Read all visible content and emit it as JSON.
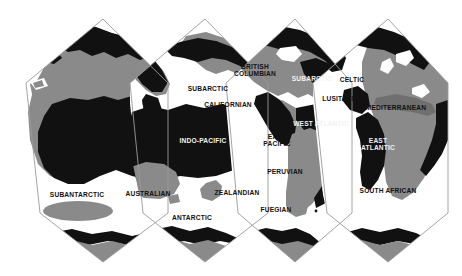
{
  "map": {
    "title": "Marine biogeographic provinces world map",
    "projection": "interrupted equal-area (Goode-homolosine style), four lobes",
    "colors": {
      "ocean_open": "#ffffff",
      "land": "#8a8a8a",
      "shelf_province_fill": "#111111",
      "graticule_outline": "#9a9a9a",
      "label_dark": "#111111",
      "label_light": "#f2f2f2",
      "background": "#ffffff"
    },
    "legend_note": "Black = warm/shelf marine provinces, Gray = land, White = labelled cold-water provinces",
    "labels": [
      {
        "id": "arctic",
        "text": "ARCTIC",
        "x": 205,
        "y": 44,
        "tone": "dark",
        "lines": 1
      },
      {
        "id": "british-columbian",
        "text": "BRITISH\nCOLUMBIAN",
        "x": 255,
        "y": 70,
        "tone": "dark",
        "lines": 2
      },
      {
        "id": "subarctic-pacific",
        "text": "SUBARCTIC",
        "x": 208,
        "y": 89,
        "tone": "dark",
        "lines": 1
      },
      {
        "id": "californian",
        "text": "CALIFORNIAN",
        "x": 228,
        "y": 105,
        "tone": "dark",
        "lines": 1
      },
      {
        "id": "subarctic-atlantic",
        "text": "SUBARCTIC",
        "x": 312,
        "y": 79,
        "tone": "light",
        "lines": 1
      },
      {
        "id": "celtic",
        "text": "CELTIC",
        "x": 352,
        "y": 80,
        "tone": "dark",
        "lines": 1
      },
      {
        "id": "lusitanian",
        "text": "LUSITANIAN",
        "x": 343,
        "y": 99,
        "tone": "dark",
        "lines": 1
      },
      {
        "id": "mediterranean",
        "text": "MEDITERRANEAN",
        "x": 396,
        "y": 108,
        "tone": "dark",
        "lines": 1
      },
      {
        "id": "west-atlantic",
        "text": "WEST ATLANTIC",
        "x": 321,
        "y": 124,
        "tone": "light",
        "lines": 1
      },
      {
        "id": "east-atlantic",
        "text": "EAST\nATLANTIC",
        "x": 378,
        "y": 144,
        "tone": "light",
        "lines": 2
      },
      {
        "id": "indo-pacific",
        "text": "INDO-PACIFIC",
        "x": 203,
        "y": 141,
        "tone": "light",
        "lines": 1
      },
      {
        "id": "east-pacific",
        "text": "EAST\nPACIFIC",
        "x": 277,
        "y": 140,
        "tone": "dark",
        "lines": 2
      },
      {
        "id": "peruvian",
        "text": "PERUVIAN",
        "x": 285,
        "y": 172,
        "tone": "dark",
        "lines": 1
      },
      {
        "id": "fuegian",
        "text": "FUEGIAN",
        "x": 276,
        "y": 210,
        "tone": "dark",
        "lines": 1
      },
      {
        "id": "south-african",
        "text": "SOUTH AFRICAN",
        "x": 388,
        "y": 191,
        "tone": "dark",
        "lines": 1
      },
      {
        "id": "subantarctic",
        "text": "SUBANTARCTIC",
        "x": 77,
        "y": 195,
        "tone": "dark",
        "lines": 1
      },
      {
        "id": "australian",
        "text": "AUSTRALIAN",
        "x": 148,
        "y": 194,
        "tone": "dark",
        "lines": 1
      },
      {
        "id": "zealandian",
        "text": "ZEALANDIAN",
        "x": 237,
        "y": 193,
        "tone": "dark",
        "lines": 1
      },
      {
        "id": "antarctic",
        "text": "ANTARCTIC",
        "x": 192,
        "y": 218,
        "tone": "dark",
        "lines": 1
      }
    ]
  }
}
